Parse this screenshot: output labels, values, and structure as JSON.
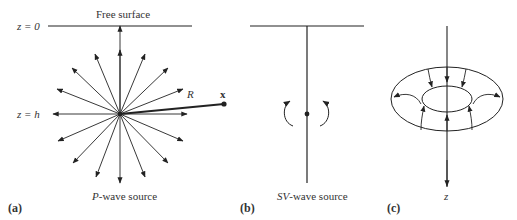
{
  "panel_a": {
    "label": "(a)",
    "caption_italic": "P",
    "caption_rest": "-wave source",
    "surface_label": "Free surface",
    "z0_label": "z = 0",
    "zh_label": "z = h",
    "distance_label": "R",
    "point_label": "x"
  },
  "panel_b": {
    "label": "(b)",
    "caption_italic": "SV",
    "caption_rest": "-wave source"
  },
  "panel_c": {
    "label": "(c)",
    "axis_label": "z"
  },
  "colors": {
    "line": "#222222",
    "background": "#ffffff"
  }
}
